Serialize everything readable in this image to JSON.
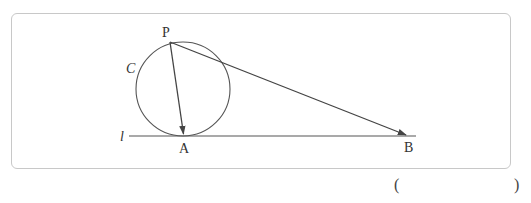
{
  "figure": {
    "labels": {
      "point_p": "P",
      "point_a": "A",
      "point_b": "B",
      "circle": "C",
      "line": "l"
    },
    "circle": {
      "cx": 183,
      "cy": 89,
      "r": 47
    },
    "points": {
      "P": [
        170,
        42
      ],
      "A": [
        184,
        136
      ],
      "B": [
        408,
        136
      ]
    },
    "line_l": {
      "x1": 129,
      "x2": 416,
      "y": 136
    },
    "vectors": [
      "PA",
      "PB"
    ]
  },
  "answer": {
    "open_paren": "(",
    "close_paren": ")",
    "blank": ""
  }
}
